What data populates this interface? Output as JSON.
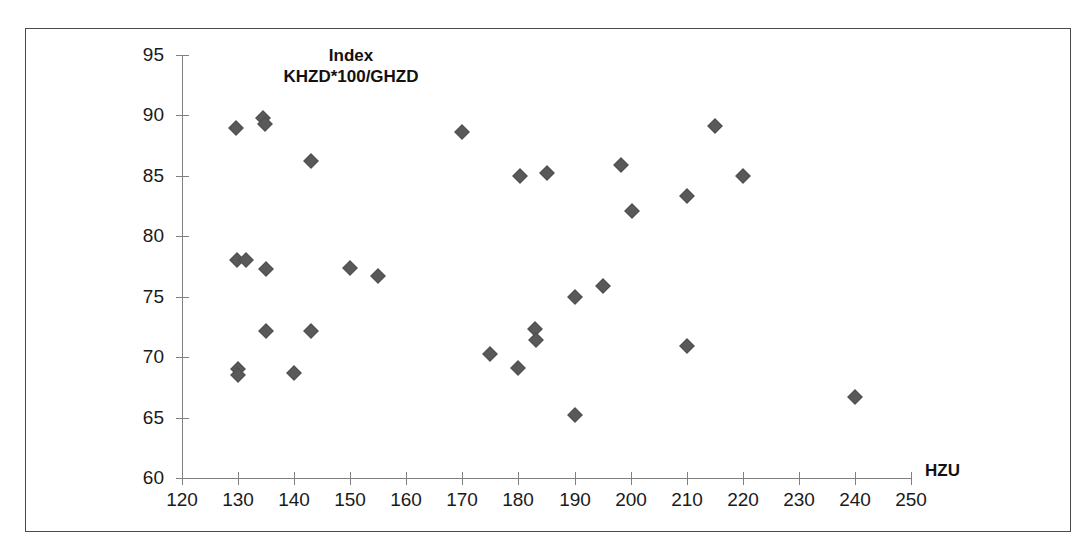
{
  "chart_data": {
    "type": "scatter",
    "title": "Index KHZD*100/GHZD",
    "title_lines": [
      "Index",
      "KHZD*100/GHZD"
    ],
    "xlabel": "HZU",
    "ylabel": "",
    "xlim": [
      120,
      250
    ],
    "ylim": [
      60,
      95
    ],
    "xticks": [
      120,
      130,
      140,
      150,
      160,
      170,
      180,
      190,
      200,
      210,
      220,
      230,
      240,
      250
    ],
    "yticks": [
      60,
      65,
      70,
      75,
      80,
      85,
      90,
      95
    ],
    "grid": false,
    "legend": "none",
    "marker": "diamond",
    "marker_color": "#595959",
    "points": [
      {
        "x": 129.6,
        "y": 89.0
      },
      {
        "x": 134.4,
        "y": 89.8
      },
      {
        "x": 134.8,
        "y": 89.3
      },
      {
        "x": 143.0,
        "y": 86.2
      },
      {
        "x": 170.0,
        "y": 88.6
      },
      {
        "x": 180.2,
        "y": 85.0
      },
      {
        "x": 185.0,
        "y": 85.2
      },
      {
        "x": 198.2,
        "y": 85.9
      },
      {
        "x": 215.0,
        "y": 89.1
      },
      {
        "x": 220.0,
        "y": 85.0
      },
      {
        "x": 200.2,
        "y": 82.1
      },
      {
        "x": 210.0,
        "y": 83.3
      },
      {
        "x": 129.8,
        "y": 78.0
      },
      {
        "x": 131.4,
        "y": 78.0
      },
      {
        "x": 135.0,
        "y": 77.3
      },
      {
        "x": 150.0,
        "y": 77.4
      },
      {
        "x": 155.0,
        "y": 76.7
      },
      {
        "x": 190.0,
        "y": 75.0
      },
      {
        "x": 195.0,
        "y": 75.9
      },
      {
        "x": 135.0,
        "y": 72.2
      },
      {
        "x": 143.0,
        "y": 72.2
      },
      {
        "x": 183.0,
        "y": 72.3
      },
      {
        "x": 183.2,
        "y": 71.4
      },
      {
        "x": 175.0,
        "y": 70.3
      },
      {
        "x": 210.0,
        "y": 70.9
      },
      {
        "x": 130.0,
        "y": 69.0
      },
      {
        "x": 130.0,
        "y": 68.5
      },
      {
        "x": 140.0,
        "y": 68.7
      },
      {
        "x": 180.0,
        "y": 69.1
      },
      {
        "x": 190.0,
        "y": 65.2
      },
      {
        "x": 240.0,
        "y": 66.7
      }
    ]
  }
}
